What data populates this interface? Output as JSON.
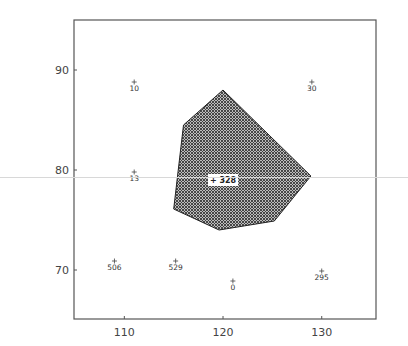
{
  "chart_data": {
    "type": "scatter",
    "title": "",
    "xlabel": "",
    "ylabel": "",
    "xlim": [
      104.9,
      135.5
    ],
    "ylim": [
      65.1,
      95
    ],
    "grid": false,
    "legend": null,
    "x_ticks": [
      110,
      120,
      130
    ],
    "y_ticks": [
      70,
      80,
      90
    ],
    "x_tick_labels": [
      "110",
      "120",
      "130"
    ],
    "y_tick_labels": [
      "70",
      "80",
      "90"
    ],
    "points": [
      {
        "label": "10",
        "x": 111,
        "y": 88.8
      },
      {
        "label": "30",
        "x": 129,
        "y": 88.8
      },
      {
        "label": "13",
        "x": 111,
        "y": 79.8
      },
      {
        "label": "506",
        "x": 109,
        "y": 70.9
      },
      {
        "label": "529",
        "x": 115.2,
        "y": 70.9
      },
      {
        "label": "0",
        "x": 121,
        "y": 68.9
      },
      {
        "label": "295",
        "x": 130,
        "y": 69.9
      }
    ],
    "region": {
      "label": "328",
      "label_point": {
        "x": 120,
        "y": 79
      },
      "fill": "crosshatch",
      "vertices": [
        {
          "x": 120,
          "y": 88
        },
        {
          "x": 116,
          "y": 84.5
        },
        {
          "x": 115,
          "y": 76.1
        },
        {
          "x": 119.6,
          "y": 74
        },
        {
          "x": 125.2,
          "y": 74.9
        },
        {
          "x": 128.9,
          "y": 79.4
        }
      ]
    }
  },
  "colors": {
    "frame": "#555555",
    "hatch_dark": "#3a3a3a",
    "hatch_light": "#bdbdbd",
    "region_outline": "#222222"
  }
}
